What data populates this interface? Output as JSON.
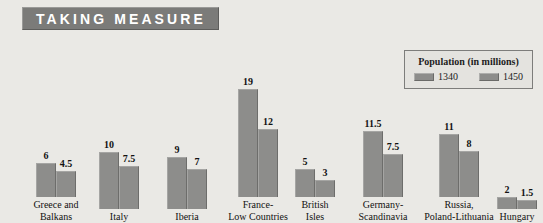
{
  "title": {
    "text": "TAKING MEASURE"
  },
  "legend": {
    "title": "Population (in millions)",
    "items": [
      {
        "label": "1340",
        "color": "#8d8d8b"
      },
      {
        "label": "1450",
        "color": "#8d8d8b"
      }
    ]
  },
  "chart_data": {
    "type": "bar",
    "title": "TAKING MEASURE",
    "xlabel": "",
    "ylabel": "Population (in millions)",
    "ylim": [
      0,
      19
    ],
    "grid": false,
    "legend_position": "top-right",
    "categories": [
      "Greece and\nBalkans",
      "Italy",
      "Iberia",
      "France-\nLow Countries",
      "British\nIsles",
      "Germany-\nScandinavia",
      "Russia,\nPoland-Lithuania",
      "Hungary"
    ],
    "series": [
      {
        "name": "1340",
        "color": "#8d8d8b",
        "values": [
          6,
          10,
          9,
          19,
          5,
          11.5,
          11,
          2
        ],
        "labels": [
          "6",
          "10",
          "9",
          "19",
          "5",
          "11.5",
          "11",
          "2"
        ]
      },
      {
        "name": "1450",
        "color": "#8d8d8b",
        "values": [
          4.5,
          7.5,
          7,
          12,
          3,
          7.5,
          8,
          1.5
        ],
        "labels": [
          "4.5",
          "7.5",
          "7",
          "12",
          "3",
          "7.5",
          "8",
          "1.5"
        ]
      }
    ]
  },
  "layout": {
    "groups": [
      {
        "left": 17,
        "label_width": 78
      },
      {
        "left": 84,
        "label_width": 70
      },
      {
        "left": 152,
        "label_width": 70
      },
      {
        "left": 212,
        "label_width": 92
      },
      {
        "left": 283,
        "label_width": 64
      },
      {
        "left": 340,
        "label_width": 86
      },
      {
        "left": 409,
        "label_width": 100
      },
      {
        "left": 490,
        "label_width": 54
      }
    ],
    "baseline_y": 188,
    "px_per_unit": 5.7,
    "bar_width": 20
  }
}
